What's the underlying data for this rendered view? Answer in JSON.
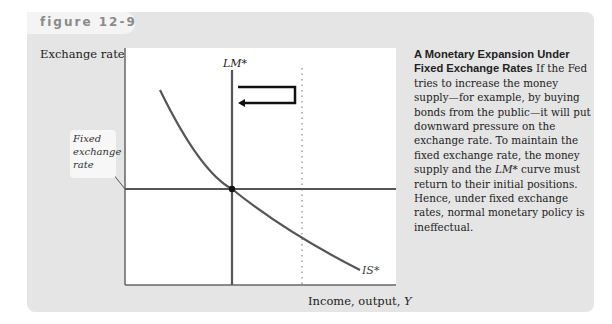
{
  "figure": {
    "label": "figure 12-9"
  },
  "axes": {
    "y_label_text": "Exchange rate, ",
    "y_label_var": "e",
    "x_label_text": "Income, output, ",
    "x_label_var": "Y"
  },
  "annotations": {
    "fixed_rate_line1": "Fixed",
    "fixed_rate_line2": "exchange",
    "fixed_rate_line3": "rate",
    "lm_curve": "LM*",
    "is_curve": "IS*"
  },
  "caption": {
    "title": "A Monetary Expansion Under Fixed Exchange Rates",
    "body_part1": "  If the Fed tries to increase the money supply—for example, by buying bonds from the public—it will put downward pressure on the exchange rate. To maintain the fixed exchange rate, the money supply and the ",
    "body_italic": "LM*",
    "body_part2": " curve must return to their initial positions. Hence, under fixed exchange rates, normal monetary policy is ineffectual."
  },
  "colors": {
    "panel_bg": "#e5e5e5",
    "curve": "#555555",
    "axis": "#666666",
    "arrow": "#111111"
  }
}
